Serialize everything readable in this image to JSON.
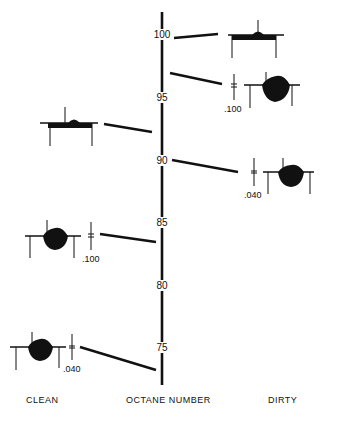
{
  "axis": {
    "title": "OCTANE NUMBER",
    "ticks": [
      "100",
      "95",
      "90",
      "85",
      "80",
      "75"
    ]
  },
  "categories": {
    "left": "CLEAN",
    "right": "DIRTY"
  },
  "figures": [
    {
      "side": "dirty",
      "octane": 100,
      "deposit": "none",
      "gap": ""
    },
    {
      "side": "dirty",
      "octane": 96,
      "deposit": "large",
      "gap": ".100"
    },
    {
      "side": "clean",
      "octane": 93,
      "deposit": "none",
      "gap": ""
    },
    {
      "side": "dirty",
      "octane": 90,
      "deposit": "large",
      "gap": ".040"
    },
    {
      "side": "clean",
      "octane": 84,
      "deposit": "large",
      "gap": ".100"
    },
    {
      "side": "clean",
      "octane": 74,
      "deposit": "large",
      "gap": ".040"
    }
  ],
  "colors": {
    "ink": "#111111",
    "background": "#ffffff"
  }
}
